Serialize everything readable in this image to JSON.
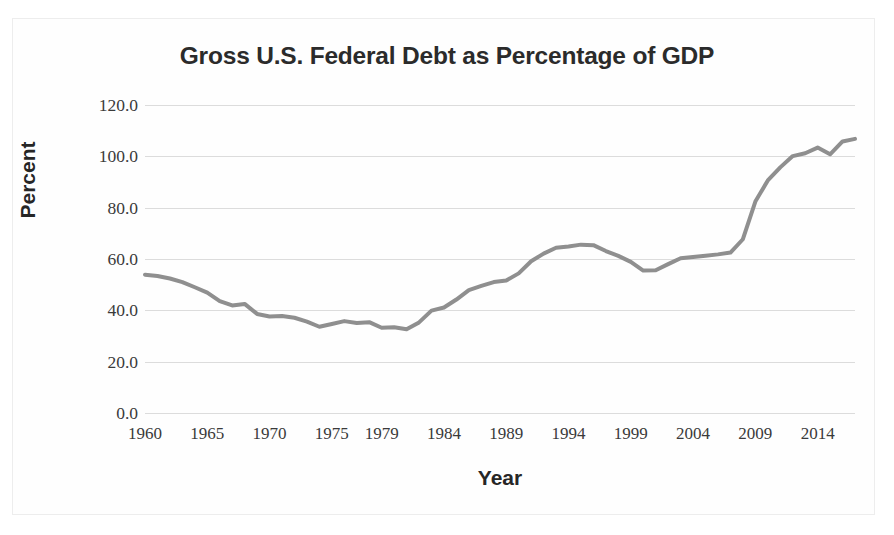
{
  "chart_data": {
    "type": "line",
    "title": "Gross U.S. Federal Debt as Percentage of GDP",
    "xlabel": "Year",
    "ylabel": "Percent",
    "ylim": [
      0.0,
      120.0
    ],
    "xlim": [
      1960,
      2017
    ],
    "grid": true,
    "legend": "none",
    "ytick_labels": [
      "120.0",
      "100.0",
      "80.0",
      "60.0",
      "40.0",
      "20.0",
      "0.0"
    ],
    "ytick_values": [
      120.0,
      100.0,
      80.0,
      60.0,
      40.0,
      20.0,
      0.0
    ],
    "xtick_labels": [
      "1960",
      "1965",
      "1970",
      "1975",
      "1979",
      "1984",
      "1989",
      "1994",
      "1999",
      "2004",
      "2009",
      "2014"
    ],
    "xtick_values": [
      1960,
      1965,
      1970,
      1975,
      1979,
      1984,
      1989,
      1994,
      1999,
      2004,
      2009,
      2014
    ],
    "line_color": "#8f8f8f",
    "line_width": 4,
    "gridline_color": "#dcdcdc",
    "background_color": "#ffffff",
    "x": [
      1960,
      1961,
      1962,
      1963,
      1964,
      1965,
      1966,
      1967,
      1968,
      1969,
      1970,
      1971,
      1972,
      1973,
      1974,
      1975,
      1976,
      1977,
      1978,
      1979,
      1980,
      1981,
      1982,
      1983,
      1984,
      1985,
      1986,
      1987,
      1988,
      1989,
      1990,
      1991,
      1992,
      1993,
      1994,
      1995,
      1996,
      1997,
      1998,
      1999,
      2000,
      2001,
      2002,
      2003,
      2004,
      2005,
      2006,
      2007,
      2008,
      2009,
      2010,
      2011,
      2012,
      2013,
      2014,
      2015,
      2016,
      2017
    ],
    "values": [
      53.9,
      53.4,
      52.4,
      51.0,
      49.0,
      46.9,
      43.6,
      41.9,
      42.5,
      38.6,
      37.6,
      37.8,
      37.1,
      35.6,
      33.6,
      34.7,
      35.8,
      35.1,
      35.4,
      33.2,
      33.4,
      32.6,
      35.3,
      39.9,
      41.1,
      44.2,
      47.9,
      49.5,
      51.0,
      51.6,
      54.4,
      59.1,
      62.1,
      64.4,
      64.9,
      65.6,
      65.4,
      63.1,
      61.2,
      58.9,
      55.5,
      55.6,
      58.0,
      60.3,
      60.8,
      61.3,
      61.8,
      62.5,
      67.7,
      82.4,
      90.6,
      95.7,
      100.1,
      101.2,
      103.4,
      100.8,
      105.8,
      106.8
    ],
    "units": "percent of GDP"
  },
  "figure": {
    "border_color": "#ededed"
  }
}
